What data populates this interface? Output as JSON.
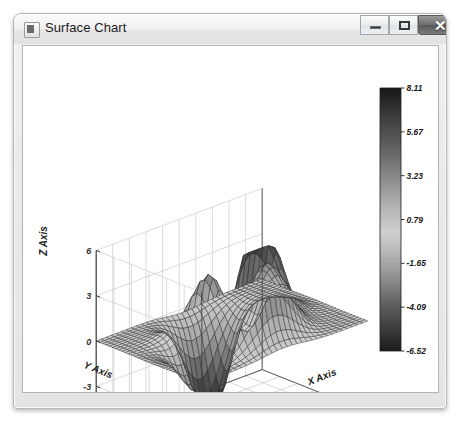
{
  "window": {
    "title": "Surface Chart",
    "icon": "app-icon",
    "controls": {
      "minimize_label": "—",
      "maximize_label": "□",
      "close_label": "✕"
    }
  },
  "chart_data": {
    "type": "surface",
    "title": "",
    "xlabel": "X Axis",
    "ylabel": "Y Axis",
    "zlabel": "Z Axis",
    "xlim": [
      -5,
      5
    ],
    "ylim": [
      -3,
      3
    ],
    "zlim": [
      -6,
      6
    ],
    "xticks": [
      -5,
      -4,
      -3,
      -2,
      -1,
      0,
      1,
      2,
      3,
      4,
      5
    ],
    "xtick_labels": [
      "-5",
      "-4",
      "-3",
      "-2",
      "-1",
      "0",
      "1",
      "2",
      "3",
      "4",
      "5"
    ],
    "yticks": [
      3,
      2,
      1,
      0,
      -1,
      -2,
      -3
    ],
    "ytick_labels": [
      "3",
      "2",
      "1",
      "0",
      "-1",
      "-2",
      "-3"
    ],
    "zticks": [
      6,
      3,
      0,
      -3,
      -6
    ],
    "ztick_labels": [
      "6",
      "3",
      "0",
      "-3",
      "-6"
    ],
    "grid": true,
    "colormap": "grayscale",
    "colorbar": {
      "position": "right",
      "vmin": -6.52,
      "vmax": 8.11,
      "tick_labels": [
        "8.11",
        "5.67",
        "3.23",
        "0.79",
        "-1.65",
        "-4.09",
        "-6.52"
      ],
      "tick_values": [
        8.11,
        5.67,
        3.23,
        0.79,
        -1.65,
        -4.09,
        -6.52
      ]
    },
    "surface_function": "peaks",
    "surface_extrema": {
      "max": 8.11,
      "min": -6.52
    },
    "grid_resolution": {
      "nx": 33,
      "ny": 33
    },
    "view": {
      "azimuth": -37.5,
      "elevation": 30
    }
  }
}
